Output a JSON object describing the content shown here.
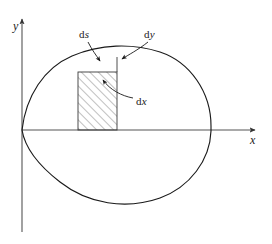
{
  "figure": {
    "type": "diagram",
    "background_color": "#ffffff",
    "stroke_color": "#1a1a1a",
    "axis_color": "#555555",
    "hatch_color": "#4a4a4a"
  },
  "axes": {
    "x_label": "x",
    "y_label": "y",
    "origin": {
      "x": 22,
      "y": 130
    },
    "x_axis": {
      "x1": 22,
      "y1": 130,
      "x2": 258,
      "y2": 130,
      "arrow": "right"
    },
    "y_axis": {
      "x1": 22,
      "y1": 232,
      "x2": 22,
      "y2": 16,
      "arrow": "up"
    }
  },
  "curve": {
    "name": "closed-curve",
    "closed": true,
    "passes_through_origin": true,
    "rightmost_x": 211,
    "top_y": 49,
    "bottom_y": 205
  },
  "strip": {
    "name": "differential-strip",
    "left": 78,
    "right": 117,
    "top": 72,
    "bottom": 130,
    "hatch_angle_deg": 45,
    "hatch_spacing": 6
  },
  "annotations": [
    {
      "id": "ds",
      "text": "d",
      "variable": "s",
      "label": "ds",
      "label_x": 79,
      "label_y": 29,
      "points_to": "curve-arc-above-strip"
    },
    {
      "id": "dy",
      "text": "d",
      "variable": "y",
      "label": "dy",
      "label_x": 144,
      "label_y": 29,
      "points_to": "strip-right-edge-top"
    },
    {
      "id": "dx",
      "text": "d",
      "variable": "x",
      "label": "dx",
      "label_x": 136,
      "label_y": 96,
      "points_to": "strip-interior"
    }
  ]
}
